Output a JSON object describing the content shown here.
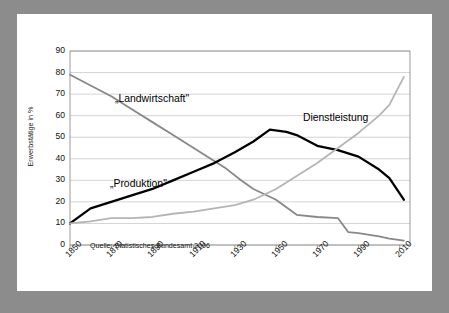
{
  "page": {
    "background_color": "#ffffff",
    "frame_color": "#8c8c8c"
  },
  "chart_data": {
    "type": "line",
    "title": "",
    "subtitle": "",
    "xlabel": "",
    "ylabel": "Erwerbstätige in %",
    "xlim": [
      1850,
      2015
    ],
    "ylim": [
      0,
      90
    ],
    "grid": true,
    "grid_axis": "y",
    "legend": "inline-annotations",
    "source_note": "Quelle: Statistisches Bundesamt 2006",
    "y_ticks": [
      0,
      10,
      20,
      30,
      40,
      50,
      60,
      70,
      80,
      90
    ],
    "x_ticks": [
      1850,
      1870,
      1890,
      1910,
      1930,
      1950,
      1970,
      1990,
      2010
    ],
    "x_tick_labels": [
      "1850",
      "1870",
      "1890",
      "1910",
      "1930",
      "1950",
      "1970",
      "1990",
      "2010"
    ],
    "y_tick_labels": [
      "0",
      "10",
      "20",
      "30",
      "40",
      "50",
      "60",
      "70",
      "80",
      "90"
    ],
    "series": [
      {
        "name": "„Landwirtschaft\"",
        "color": "#888888",
        "label_text": "„Landwirtschaft\"",
        "x": [
          1850,
          1860,
          1870,
          1880,
          1890,
          1900,
          1910,
          1920,
          1925,
          1933,
          1939,
          1950,
          1960,
          1970,
          1980,
          1985,
          1990,
          2000,
          2005,
          2012
        ],
        "values": [
          79,
          74,
          69,
          63,
          57,
          51,
          45,
          39,
          36,
          30,
          26,
          21,
          14,
          13,
          12.5,
          6,
          5.5,
          4,
          3,
          2
        ]
      },
      {
        "name": "„Produktion\"",
        "color": "#000000",
        "label_text": "„Produktion\"",
        "x": [
          1850,
          1860,
          1870,
          1880,
          1890,
          1900,
          1910,
          1920,
          1930,
          1939,
          1947,
          1955,
          1960,
          1970,
          1980,
          1990,
          2000,
          2005,
          2012
        ],
        "values": [
          10,
          17,
          20,
          23,
          26,
          30,
          34,
          38,
          43,
          48,
          53.5,
          52.5,
          51,
          46,
          44,
          41,
          35,
          31,
          21
        ]
      },
      {
        "name": "Dienstleistung",
        "color": "#b5b5b5",
        "label_text": "Dienstleistung",
        "x": [
          1850,
          1860,
          1870,
          1880,
          1890,
          1900,
          1910,
          1920,
          1930,
          1939,
          1950,
          1960,
          1970,
          1980,
          1990,
          2000,
          2005,
          2012
        ],
        "values": [
          10,
          11,
          12.5,
          12.5,
          13,
          14.5,
          15.5,
          17,
          18.5,
          21,
          26,
          32,
          38,
          45,
          52,
          60,
          65,
          78
        ]
      }
    ]
  },
  "annotations": [
    {
      "name": "landwirtschaft-label",
      "text": "„Landwirtschaft\"",
      "x_px": 98,
      "y_px": 79
    },
    {
      "name": "produktion-label",
      "text": "„Produktion\"",
      "x_px": 93,
      "y_px": 164
    },
    {
      "name": "dienstleistung-label",
      "text": "Dienstleistung",
      "x_px": 286,
      "y_px": 98
    }
  ]
}
